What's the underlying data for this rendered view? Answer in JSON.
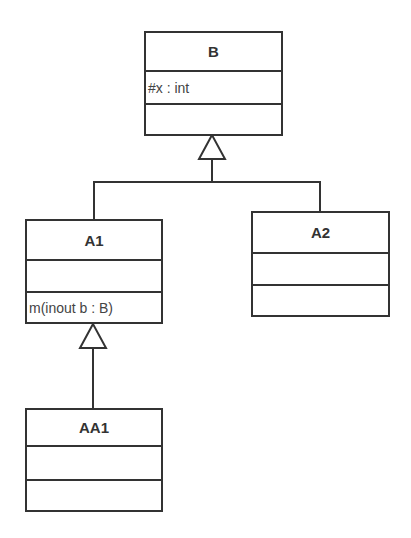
{
  "diagram": {
    "type": "uml-class-diagram",
    "classes": [
      {
        "id": "B",
        "name": "B",
        "attributes": [
          "#x : int"
        ],
        "operations": []
      },
      {
        "id": "A1",
        "name": "A1",
        "attributes": [],
        "operations": [
          "m(inout b : B)"
        ]
      },
      {
        "id": "A2",
        "name": "A2",
        "attributes": [],
        "operations": []
      },
      {
        "id": "AA1",
        "name": "AA1",
        "attributes": [],
        "operations": []
      }
    ],
    "relations": [
      {
        "type": "generalization",
        "from": "A1",
        "to": "B"
      },
      {
        "type": "generalization",
        "from": "A2",
        "to": "B"
      },
      {
        "type": "generalization",
        "from": "AA1",
        "to": "A1"
      }
    ],
    "colors": {
      "line": "#333333",
      "background": "#ffffff",
      "text": "#333333"
    }
  }
}
